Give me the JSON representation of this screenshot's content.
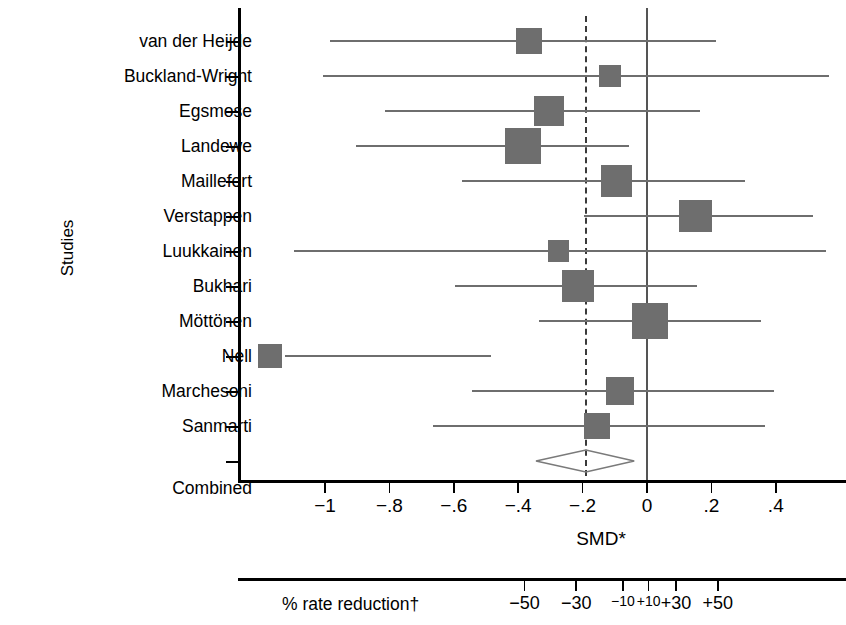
{
  "axis": {
    "y_axis_title": "Studies",
    "x_axis_title": "SMD*",
    "x_ticks": [
      "−1",
      "−.8",
      "−.6",
      "−.4",
      "−.2",
      "0",
      ".2",
      ".4"
    ],
    "rate_axis_label": "% rate reduction†",
    "rate_ticks": [
      "−50",
      "−30",
      "−10",
      "+10",
      "+30",
      "+50"
    ]
  },
  "chart_data": {
    "type": "forest",
    "title": "",
    "xlabel": "SMD*",
    "ylabel": "Studies",
    "xlim": [
      -1.12,
      0.56
    ],
    "x_ticks": [
      -1,
      -0.8,
      -0.6,
      -0.4,
      -0.2,
      0,
      0.2,
      0.4
    ],
    "x_tick_labels": [
      "−1",
      "−.8",
      "−.6",
      "−.4",
      "−.2",
      "0",
      ".2",
      ".4"
    ],
    "secondary_axis": {
      "label": "% rate reduction†",
      "ticks": [
        -50,
        -30,
        -10,
        10,
        30,
        50
      ],
      "tick_labels": [
        "−50",
        "−30",
        "−10",
        "+10",
        "+30",
        "+50"
      ],
      "tick_positions_smd": [
        -0.38,
        -0.22,
        -0.075,
        0.005,
        0.09,
        0.22
      ]
    },
    "null_line": 0,
    "pooled_line": -0.19,
    "legend": [],
    "grid": false,
    "studies": [
      {
        "label": "van der Heijde",
        "smd": -0.365,
        "ci_low": -0.985,
        "ci_high": 0.215,
        "weight": 0.4
      },
      {
        "label": "Buckland-Wright",
        "smd": -0.115,
        "ci_low": -1.005,
        "ci_high": 0.565,
        "weight": 0.26
      },
      {
        "label": "Egsmose",
        "smd": -0.305,
        "ci_low": -0.815,
        "ci_high": 0.165,
        "weight": 0.52
      },
      {
        "label": "Landewe",
        "smd": -0.385,
        "ci_low": -0.905,
        "ci_high": -0.055,
        "weight": 0.72
      },
      {
        "label": "Maillefert",
        "smd": -0.095,
        "ci_low": -0.575,
        "ci_high": 0.305,
        "weight": 0.58
      },
      {
        "label": "Verstappen",
        "smd": 0.15,
        "ci_low": -0.195,
        "ci_high": 0.515,
        "weight": 0.62
      },
      {
        "label": "Luukkainen",
        "smd": -0.275,
        "ci_low": -1.095,
        "ci_high": 0.555,
        "weight": 0.26
      },
      {
        "label": "Bukhari",
        "smd": -0.215,
        "ci_low": -0.595,
        "ci_high": 0.155,
        "weight": 0.6
      },
      {
        "label": "Möttönen",
        "smd": 0.01,
        "ci_low": -0.335,
        "ci_high": 0.355,
        "weight": 0.72
      },
      {
        "label": "Nell",
        "smd": -1.17,
        "ci_low": -1.125,
        "ci_high": -0.485,
        "weight": 0.34
      },
      {
        "label": "Marchesoni",
        "smd": -0.085,
        "ci_low": -0.545,
        "ci_high": 0.395,
        "weight": 0.46
      },
      {
        "label": "Sanmarti",
        "smd": -0.155,
        "ci_low": -0.665,
        "ci_high": 0.365,
        "weight": 0.42
      }
    ],
    "combined": {
      "label": "Combined",
      "smd": -0.19,
      "ci_low": -0.345,
      "ci_high": -0.04
    }
  },
  "colors": {
    "marker": "#6e6e6e",
    "axis": "#000000",
    "null_line": "#555555",
    "pooled_line": "#3a3a3a"
  }
}
